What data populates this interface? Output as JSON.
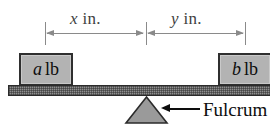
{
  "figure": {
    "background_color": "#ffffff"
  },
  "dimensions": {
    "left": {
      "variable": "x",
      "unit": "in.",
      "label": "x in."
    },
    "right": {
      "variable": "y",
      "unit": "in.",
      "label": "y in."
    }
  },
  "weights": {
    "left_block": {
      "variable": "a",
      "unit": "lb",
      "label": "a lb",
      "fill_color": "#b3b3b3",
      "border_color": "#2f2f2f"
    },
    "right_block": {
      "variable": "b",
      "unit": "lb",
      "label": "b lb",
      "fill_color": "#b3b3b3",
      "border_color": "#2f2f2f"
    }
  },
  "beam": {
    "fill_color": "#8f8f8f",
    "border_color": "#2b2b2b"
  },
  "fulcrum": {
    "callout_label": "Fulcrum",
    "fill_color": "#9a9a9a",
    "border_color": "#2b2b2b"
  }
}
